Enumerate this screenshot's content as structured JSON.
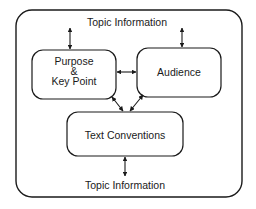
{
  "diagram": {
    "outer_frame": {
      "label_top": "Topic Information",
      "label_bottom": "Topic Information"
    },
    "nodes": [
      {
        "id": "purpose",
        "lines": [
          "Purpose",
          "&",
          "Key Point"
        ]
      },
      {
        "id": "audience",
        "label": "Audience"
      },
      {
        "id": "text_conventions",
        "label": "Text Conventions"
      }
    ],
    "edges": [
      {
        "from": "topic_information_top",
        "to": "purpose",
        "type": "bidirectional"
      },
      {
        "from": "topic_information_top",
        "to": "audience",
        "type": "bidirectional"
      },
      {
        "from": "purpose",
        "to": "audience",
        "type": "bidirectional"
      },
      {
        "from": "purpose",
        "to": "text_conventions",
        "type": "bidirectional"
      },
      {
        "from": "audience",
        "to": "text_conventions",
        "type": "bidirectional"
      },
      {
        "from": "text_conventions",
        "to": "topic_information_bottom",
        "type": "bidirectional"
      }
    ],
    "colors": {
      "stroke": "#1a1a1a",
      "background": "#ffffff"
    }
  }
}
